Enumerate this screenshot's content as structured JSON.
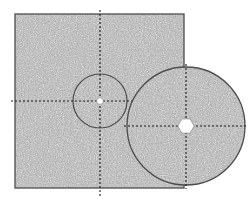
{
  "canvas": {
    "width": 250,
    "height": 202,
    "background_color": "#ffffff",
    "title": "Technical drawing of square plate and circular disc with centerlines"
  },
  "style": {
    "outline_color": "#4d4d4d",
    "outline_width": 1.2,
    "centerline_color": "#1a1a1a",
    "centerline_width": 1.1,
    "centerline_dash": "2,2",
    "hole_fill": "#ffffff",
    "texture_base_color": "#a8a8a8",
    "texture_speck_light": "#e0e0e0",
    "texture_speck_dark": "#707070",
    "texture_name": "speckled-gray-aggregate"
  },
  "shapes": {
    "square_plate": {
      "name": "square-plate",
      "x": 15,
      "y": 14,
      "width": 169,
      "height": 174,
      "fill": "texture",
      "stroke": "#4d4d4d"
    },
    "small_circle": {
      "name": "small-circle-feature",
      "cx": 100,
      "cy": 101,
      "r": 27,
      "fill": "none",
      "stroke": "#4d4d4d"
    },
    "small_hole": {
      "name": "small-center-hole",
      "cx": 100,
      "cy": 101,
      "r": 3.4,
      "fill": "#ffffff",
      "stroke": "#6a6a6a"
    },
    "large_disc": {
      "name": "large-circular-disc",
      "cx": 186,
      "cy": 126,
      "r": 59,
      "fill": "texture",
      "stroke": "#4d4d4d"
    },
    "hex_hole": {
      "name": "hexagonal-center-hole",
      "cx": 186,
      "cy": 126,
      "r": 8.2,
      "sides": 6,
      "rotation_deg": 0,
      "fill": "#ffffff",
      "stroke": "#6a6a6a"
    }
  },
  "centerlines": [
    {
      "name": "square-vertical-centerline",
      "orientation": "vertical",
      "x1": 100,
      "y1": 10,
      "x2": 100,
      "y2": 196
    },
    {
      "name": "square-horizontal-centerline",
      "orientation": "horizontal",
      "x1": 11,
      "y1": 101,
      "x2": 141,
      "y2": 101
    },
    {
      "name": "disc-vertical-centerline",
      "orientation": "vertical",
      "x1": 186,
      "y1": 64,
      "x2": 186,
      "y2": 189
    },
    {
      "name": "disc-horizontal-centerline",
      "orientation": "horizontal",
      "x1": 124,
      "y1": 126,
      "x2": 248,
      "y2": 126
    }
  ]
}
